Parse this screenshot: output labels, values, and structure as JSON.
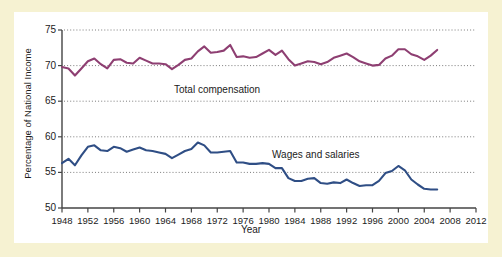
{
  "figure": {
    "background_color": "#f6f2d2",
    "panel_color": "#ffffff"
  },
  "chart_data": {
    "type": "line",
    "title": "",
    "xlabel": "Year",
    "ylabel": "Percentage of National Income",
    "xlim": [
      1948,
      2012
    ],
    "ylim": [
      50,
      75
    ],
    "grid": "horizontal-dotted",
    "legend": "inline-annotations",
    "yticks": [
      50,
      55,
      60,
      65,
      70,
      75
    ],
    "xticks": [
      1948,
      1952,
      1956,
      1960,
      1964,
      1968,
      1972,
      1976,
      1980,
      1984,
      1988,
      1992,
      1996,
      2000,
      2004,
      2008,
      2012
    ],
    "series": [
      {
        "name": "Total compensation",
        "color": "#8e3f72",
        "annotation": "Total compensation",
        "x": [
          1948,
          1949,
          1950,
          1951,
          1952,
          1953,
          1954,
          1955,
          1956,
          1957,
          1958,
          1959,
          1960,
          1961,
          1962,
          1963,
          1964,
          1965,
          1966,
          1967,
          1968,
          1969,
          1970,
          1971,
          1972,
          1973,
          1974,
          1975,
          1976,
          1977,
          1978,
          1979,
          1980,
          1981,
          1982,
          1983,
          1984,
          1985,
          1986,
          1987,
          1988,
          1989,
          1990,
          1991,
          1992,
          1993,
          1994,
          1995,
          1996,
          1997,
          1998,
          1999,
          2000,
          2001,
          2002,
          2003,
          2004,
          2005,
          2006
        ],
        "values": [
          69.8,
          69.6,
          68.6,
          69.6,
          70.6,
          71.0,
          70.2,
          69.6,
          70.8,
          70.9,
          70.4,
          70.3,
          71.1,
          70.7,
          70.3,
          70.3,
          70.2,
          69.5,
          70.1,
          70.8,
          71.0,
          72.0,
          72.7,
          71.8,
          71.9,
          72.1,
          72.9,
          71.2,
          71.3,
          71.1,
          71.2,
          71.7,
          72.2,
          71.5,
          72.1,
          70.9,
          70.0,
          70.3,
          70.6,
          70.5,
          70.2,
          70.5,
          71.1,
          71.4,
          71.7,
          71.2,
          70.6,
          70.3,
          70.0,
          70.1,
          71.0,
          71.4,
          72.3,
          72.3,
          71.6,
          71.3,
          70.8,
          71.4,
          72.2
        ]
      },
      {
        "name": "Wages and salaries",
        "color": "#2f4e85",
        "annotation": "Wages and salaries",
        "x": [
          1948,
          1949,
          1950,
          1951,
          1952,
          1953,
          1954,
          1955,
          1956,
          1957,
          1958,
          1959,
          1960,
          1961,
          1962,
          1963,
          1964,
          1965,
          1966,
          1967,
          1968,
          1969,
          1970,
          1971,
          1972,
          1973,
          1974,
          1975,
          1976,
          1977,
          1978,
          1979,
          1980,
          1981,
          1982,
          1983,
          1984,
          1985,
          1986,
          1987,
          1988,
          1989,
          1990,
          1991,
          1992,
          1993,
          1994,
          1995,
          1996,
          1997,
          1998,
          1999,
          2000,
          2001,
          2002,
          2003,
          2004,
          2005,
          2006
        ],
        "values": [
          56.3,
          56.9,
          56.0,
          57.4,
          58.6,
          58.8,
          58.1,
          58.0,
          58.6,
          58.4,
          57.9,
          58.2,
          58.5,
          58.1,
          58.0,
          57.8,
          57.6,
          57.0,
          57.5,
          58.0,
          58.3,
          59.2,
          58.8,
          57.8,
          57.8,
          57.9,
          58.0,
          56.4,
          56.4,
          56.2,
          56.2,
          56.3,
          56.2,
          55.6,
          55.6,
          54.2,
          53.8,
          53.8,
          54.1,
          54.2,
          53.5,
          53.4,
          53.6,
          53.5,
          54.0,
          53.5,
          53.1,
          53.2,
          53.2,
          53.8,
          54.9,
          55.2,
          55.9,
          55.3,
          54.0,
          53.3,
          52.7,
          52.6,
          52.6
        ]
      }
    ]
  },
  "axis": {
    "ytick_labels": [
      "75",
      "70",
      "65",
      "60",
      "55",
      "50"
    ],
    "xtick_labels": [
      "1948",
      "1952",
      "1956",
      "1960",
      "1964",
      "1968",
      "1972",
      "1976",
      "1980",
      "1984",
      "1988",
      "1992",
      "1996",
      "2000",
      "2004",
      "2008",
      "2012"
    ],
    "x_axis_title": "Year",
    "y_axis_title": "Percentage of National Income"
  },
  "annotations": {
    "total_compensation": "Total compensation",
    "wages_and_salaries": "Wages and salaries"
  }
}
